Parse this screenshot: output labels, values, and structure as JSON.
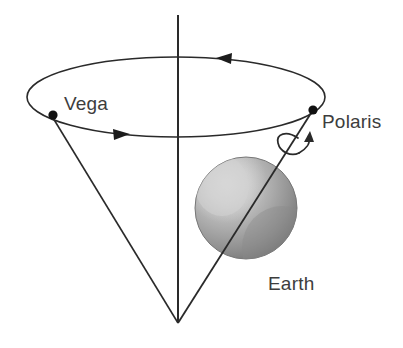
{
  "figure": {
    "background_color": "#ffffff",
    "line_color": "#2a2a2a",
    "text_color": "#3d3d3d"
  },
  "labels": {
    "vega": "Vega",
    "polaris": "Polaris",
    "earth": "Earth"
  },
  "icons": {
    "vega_marker": "star-dot-icon",
    "polaris_marker": "star-dot-icon",
    "precession_arrow_back": "arrow-left-icon",
    "precession_arrow_front": "arrow-right-icon",
    "rotation_arrow": "curved-rotation-arrow-icon",
    "earth_sphere": "sphere-icon",
    "vertical_axis": "vertical-axis-icon",
    "cone_left_edge": "cone-edge-icon",
    "cone_right_edge": "cone-edge-icon",
    "precession_circle": "ellipse-orbit-icon"
  },
  "geometry": {
    "precession_ellipse": {
      "cx": 176,
      "cy": 97,
      "rx": 149,
      "ry": 40
    },
    "cone_apex": {
      "x": 178,
      "y": 323
    },
    "vertical_axis": {
      "x": 178,
      "y_top": 15,
      "y_bottom": 323
    },
    "vega_point": {
      "x": 53,
      "y": 115
    },
    "polaris_point": {
      "x": 313,
      "y": 110
    },
    "earth_sphere": {
      "cx": 246,
      "cy": 208,
      "r": 51
    },
    "vega_label_pos": {
      "x": 64,
      "y": 117
    },
    "polaris_label_pos": {
      "x": 323,
      "y": 127
    },
    "earth_label_pos": {
      "x": 268,
      "y": 288
    },
    "back_arrow_pos": {
      "x": 226,
      "y": 58
    },
    "front_arrow_pos": {
      "x": 120,
      "y": 134
    }
  },
  "colors": {
    "sphere_highlight": "#cfcfcf",
    "sphere_mid": "#a9a9a9",
    "sphere_shadow": "#7d7d7d",
    "sphere_edge": "#6e6e6e",
    "stroke": "#2a2a2a",
    "text": "#3d3d3d",
    "dot": "#111111"
  }
}
